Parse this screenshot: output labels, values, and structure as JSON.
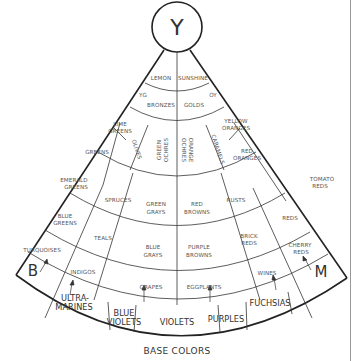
{
  "diagram": {
    "title": "BASE COLORS",
    "apex": {
      "label": "Y"
    },
    "corners": {
      "left": "B",
      "right": "M"
    },
    "colors": {
      "line": "#333333",
      "text": "#555555",
      "background": "#ffffff",
      "edge_rule": "#999999"
    },
    "rings": [
      {
        "id": "ring1",
        "cells": [
          {
            "label": "LEMON"
          },
          {
            "label": "SUNSHINE"
          }
        ]
      },
      {
        "id": "ring2",
        "cells": [
          {
            "label": "YG"
          },
          {
            "label": "BRONZES"
          },
          {
            "label": "GOLDS"
          },
          {
            "label": "OY"
          }
        ]
      },
      {
        "id": "ring3",
        "cells": [
          {
            "label": "LIME GREENS"
          },
          {
            "label": "GREENS"
          },
          {
            "label": "OLIVES"
          },
          {
            "label": "GREEN OCHRES"
          },
          {
            "label": "ORANGE OCHRES"
          },
          {
            "label": "CARAMELS"
          },
          {
            "label": "YELLOW ORANGES"
          },
          {
            "label": "RED ORANGES"
          }
        ]
      },
      {
        "id": "ring4",
        "cells": [
          {
            "label": "EMERALD GREENS"
          },
          {
            "label": "SPRUCES"
          },
          {
            "label": "GREEN GRAYS"
          },
          {
            "label": "RED BROWNS"
          },
          {
            "label": "RUSTS"
          },
          {
            "label": "TOMATO REDS"
          }
        ]
      },
      {
        "id": "ring5",
        "cells": [
          {
            "label": "BLUE GREENS"
          },
          {
            "label": "TEALS"
          },
          {
            "label": "BLUE GRAYS"
          },
          {
            "label": "PURPLE BROWNS"
          },
          {
            "label": "BRICK REDS"
          },
          {
            "label": "REDS"
          }
        ]
      },
      {
        "id": "ring6",
        "cells": [
          {
            "label": "TURQUOISES"
          },
          {
            "label": "INDIGOS"
          },
          {
            "label": "GRAPES"
          },
          {
            "label": "EGGPLANTS"
          },
          {
            "label": "WINES"
          },
          {
            "label": "CHERRY REDS"
          }
        ]
      },
      {
        "id": "ring7",
        "cells": [
          {
            "label": "ULTRA- MARINES"
          },
          {
            "label": "BLUE VIOLETS"
          },
          {
            "label": "VIOLETS"
          },
          {
            "label": "PURPLES"
          },
          {
            "label": "FUCHSIAS"
          }
        ]
      }
    ]
  }
}
